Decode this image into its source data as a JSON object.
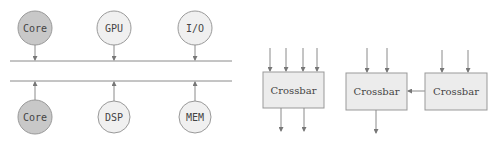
{
  "diagram": {
    "bus": {
      "top_nodes": [
        {
          "label": "Core",
          "fill": "#c8c8c8"
        },
        {
          "label": "GPU",
          "fill": "#f0f0f0"
        },
        {
          "label": "I/O",
          "fill": "#f0f0f0"
        }
      ],
      "bottom_nodes": [
        {
          "label": "Core",
          "fill": "#c8c8c8"
        },
        {
          "label": "DSP",
          "fill": "#f0f0f0"
        },
        {
          "label": "MEM",
          "fill": "#f0f0f0"
        }
      ]
    },
    "crossbars": [
      {
        "label": "Crossbar",
        "inputs": 4,
        "outputs": 2
      },
      {
        "label": "Crossbar",
        "inputs": 2,
        "outputs": 1
      },
      {
        "label": "Crossbar",
        "inputs": 2,
        "outputs": 0
      }
    ]
  },
  "colors": {
    "stroke": "#8a8a8a",
    "box_fill": "#ececec",
    "node_dark": "#c8c8c8",
    "node_light": "#f0f0f0"
  }
}
